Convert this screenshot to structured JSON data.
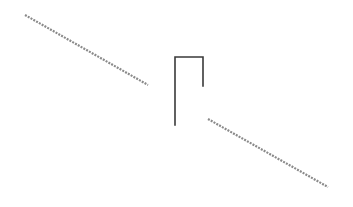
{
  "diagram": {
    "colors": {
      "background": "#ffffff",
      "hatched_line": "#8a8a8a",
      "bracket": "#3a3a3a"
    },
    "elements": [
      {
        "name": "left-hatched-segment",
        "style": "hatched",
        "direction": "descending"
      },
      {
        "name": "bracket",
        "style": "solid",
        "shape": "inverted-U open with short right leg"
      },
      {
        "name": "right-hatched-segment",
        "style": "hatched",
        "direction": "descending"
      }
    ]
  }
}
